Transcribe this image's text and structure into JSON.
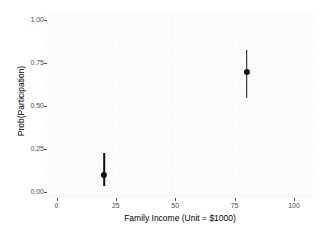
{
  "chart_data": {
    "type": "scatter",
    "title": "",
    "xlabel": "Family Income (Unit = $1000)",
    "ylabel": "Prob(Participation)",
    "xlim": [
      -4,
      108
    ],
    "ylim": [
      -0.035,
      1.04
    ],
    "grid": true,
    "legend": false,
    "x_ticks": [
      {
        "value": 0,
        "label": "0"
      },
      {
        "value": 25,
        "label": "25"
      },
      {
        "value": 50,
        "label": "50"
      },
      {
        "value": 75,
        "label": "75"
      },
      {
        "value": 100,
        "label": "100"
      }
    ],
    "y_ticks": [
      {
        "value": 0.0,
        "label": "0.00"
      },
      {
        "value": 0.25,
        "label": "0.25"
      },
      {
        "value": 0.5,
        "label": "0.50"
      },
      {
        "value": 0.75,
        "label": "0.75"
      },
      {
        "value": 1.0,
        "label": "1.00"
      }
    ],
    "x_minor_ticks": [
      12.5,
      37.5,
      62.5,
      87.5
    ],
    "y_minor_ticks": [
      0.125,
      0.375,
      0.625,
      0.875
    ],
    "points": [
      {
        "x": 20,
        "y": 0.1,
        "ymin": 0.035,
        "ymax": 0.225
      },
      {
        "x": 80,
        "y": 0.7,
        "ymin": 0.545,
        "ymax": 0.825
      }
    ],
    "marker_color": "#101010",
    "panel_color": "#fbfbfb",
    "grid_color": "#ffffff",
    "axis_text_color": "#4d4d4d"
  }
}
